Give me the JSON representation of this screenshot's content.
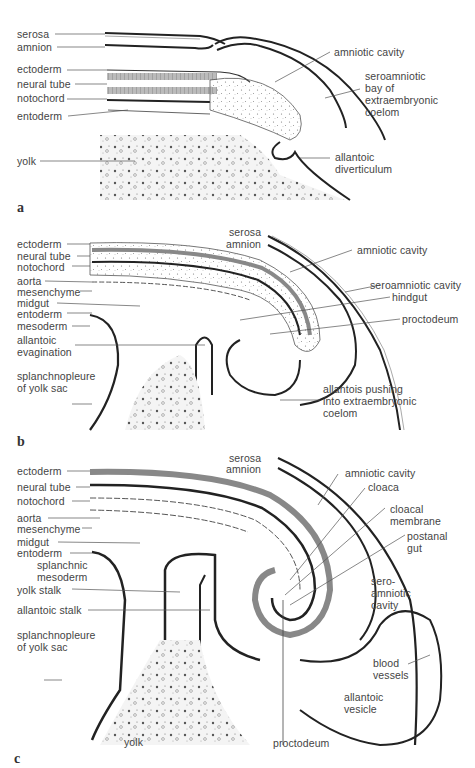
{
  "figure": {
    "panels": [
      {
        "letter": "a",
        "labels_left": [
          "serosa",
          "amnion",
          "ectoderm",
          "neural tube",
          "notochord",
          "entoderm",
          "yolk"
        ],
        "labels_right": [
          "amniotic cavity",
          "seroamniotic\nbay of\nextraembryonic\ncoelom",
          "allantoic\ndiverticulum"
        ]
      },
      {
        "letter": "b",
        "labels_left": [
          "ectoderm",
          "neural tube",
          "notochord",
          "aorta",
          "mesenchyme",
          "midgut",
          "entoderm",
          "mesoderm",
          "allantoic\nevagination",
          "splanchnopleure\nof yolk sac"
        ],
        "labels_right": [
          "serosa",
          "amnion",
          "amniotic cavity",
          "seroamniotic cavity",
          "hindgut",
          "proctodeum",
          "allantois pushing\ninto extraembryonic\ncoelom"
        ]
      },
      {
        "letter": "c",
        "labels_left": [
          "ectoderm",
          "neural tube",
          "notochord",
          "aorta",
          "mesenchyme",
          "midgut",
          "entoderm",
          "splanchnic\nmesoderm",
          "yolk stalk",
          "allantoic stalk",
          "splanchnopleure\nof yolk sac",
          "yolk"
        ],
        "labels_right": [
          "serosa",
          "amnion",
          "amniotic cavity",
          "cloaca",
          "cloacal\nmembrane",
          "postanal\ngut",
          "sero-\namniotic\ncavity",
          "blood\nvessels",
          "allantoic\nvesicle",
          "proctodeum"
        ]
      }
    ]
  }
}
